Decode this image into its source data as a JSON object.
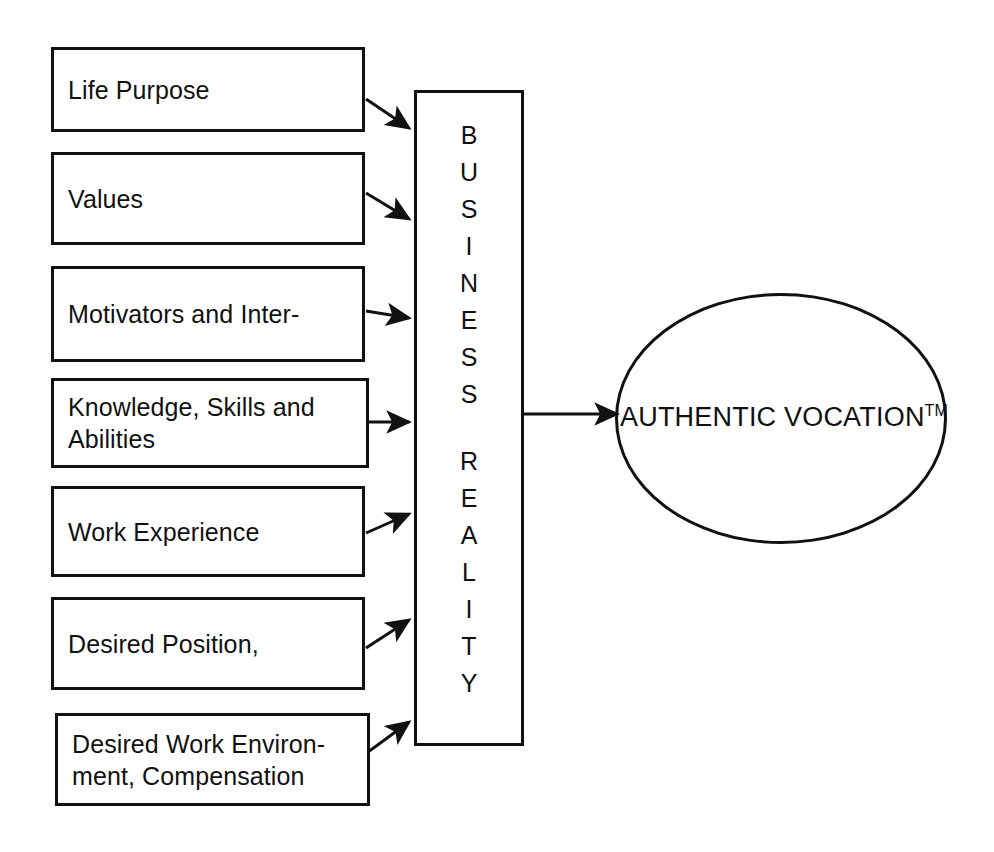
{
  "diagram": {
    "stroke_color": "#111111",
    "background_color": "#ffffff",
    "inputs": [
      {
        "id": "life-purpose",
        "label": "Life Purpose"
      },
      {
        "id": "values",
        "label": "Values"
      },
      {
        "id": "motivators",
        "label": "Motivators and Inter-"
      },
      {
        "id": "knowledge-skills",
        "label": "Knowledge, Skills and\nAbilities"
      },
      {
        "id": "work-experience",
        "label": "Work Experience"
      },
      {
        "id": "desired-position",
        "label": "Desired Position,"
      },
      {
        "id": "desired-environment",
        "label": "Desired Work Environ-\nment, Compensation"
      }
    ],
    "filter": {
      "id": "business-reality",
      "label": "BUSINESS REALITY",
      "line1": "BUSINESS",
      "line2": "REALITY",
      "letters_line1": [
        "B",
        "U",
        "S",
        "I",
        "N",
        "E",
        "S",
        "S"
      ],
      "letters_line2": [
        "R",
        "E",
        "A",
        "L",
        "I",
        "T",
        "Y"
      ],
      "orientation": "vertical-stacked-letters"
    },
    "outcome": {
      "id": "authentic-vocation",
      "label": "AUTHENTIC VOCATION",
      "trademark": "TM",
      "shape": "ellipse"
    },
    "connections": [
      {
        "from": "life-purpose",
        "to": "business-reality",
        "style": "arrow"
      },
      {
        "from": "values",
        "to": "business-reality",
        "style": "arrow"
      },
      {
        "from": "motivators",
        "to": "business-reality",
        "style": "arrow"
      },
      {
        "from": "knowledge-skills",
        "to": "business-reality",
        "style": "arrow"
      },
      {
        "from": "work-experience",
        "to": "business-reality",
        "style": "arrow"
      },
      {
        "from": "desired-position",
        "to": "business-reality",
        "style": "arrow"
      },
      {
        "from": "desired-environment",
        "to": "business-reality",
        "style": "arrow"
      },
      {
        "from": "business-reality",
        "to": "authentic-vocation",
        "style": "arrow"
      }
    ]
  }
}
